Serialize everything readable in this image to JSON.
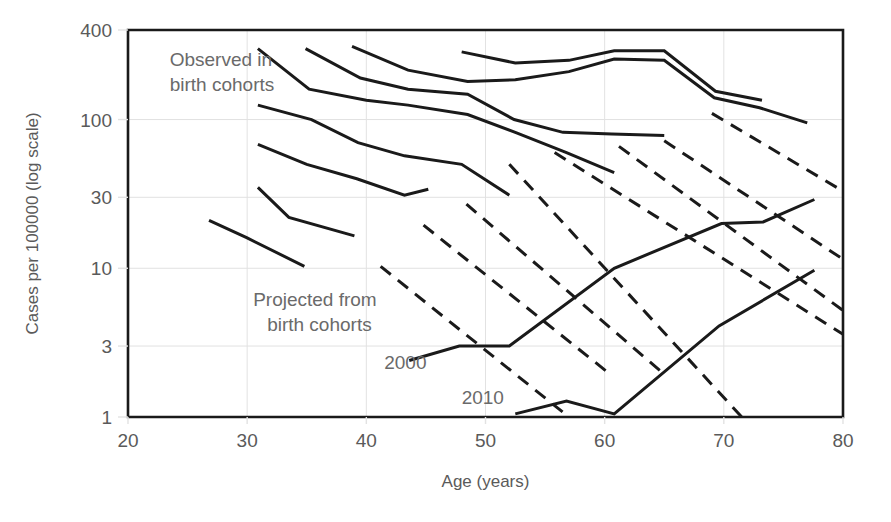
{
  "chart_data": {
    "type": "line",
    "title": "",
    "xlabel": "Age (years)",
    "ylabel": "Cases per 100000 (log scale)",
    "yscale": "log",
    "xlim": [
      20,
      80
    ],
    "ylim": [
      1,
      400
    ],
    "grid": true,
    "legend_position": "none",
    "xticks": [
      "20",
      "30",
      "40",
      "50",
      "60",
      "70",
      "80"
    ],
    "xtick_values": [
      20,
      30,
      40,
      50,
      60,
      70,
      80
    ],
    "yticks": [
      "1",
      "3",
      "10",
      "30",
      "100",
      "400"
    ],
    "ytick_values": [
      1,
      3,
      10,
      30,
      100,
      400
    ],
    "annotations": [
      {
        "id": "observed",
        "text_line1": "Observed in",
        "text_line2": "birth cohorts",
        "x": 23.5,
        "y": 230
      },
      {
        "id": "projected",
        "text_line1": "Projected from",
        "text_line2": "birth cohorts",
        "x": 30.5,
        "y": 5.6
      },
      {
        "id": "label-2000",
        "text": "2000",
        "x": 41.5,
        "y": 2.1
      },
      {
        "id": "label-2010",
        "text": "2010",
        "x": 48.0,
        "y": 1.22
      }
    ],
    "series": [
      {
        "name": "observed-cohort-1",
        "style": "solid",
        "points": [
          [
            26.8,
            21
          ],
          [
            30.0,
            16
          ],
          [
            34.8,
            10.3
          ]
        ]
      },
      {
        "name": "observed-cohort-2",
        "style": "solid",
        "points": [
          [
            30.9,
            35
          ],
          [
            33.5,
            22
          ],
          [
            39.0,
            16.5
          ]
        ]
      },
      {
        "name": "observed-cohort-3",
        "style": "solid",
        "points": [
          [
            30.9,
            68
          ],
          [
            35.0,
            50
          ],
          [
            39.2,
            40
          ],
          [
            43.2,
            31
          ],
          [
            45.2,
            34
          ]
        ]
      },
      {
        "name": "observed-cohort-4",
        "style": "solid",
        "points": [
          [
            30.9,
            125
          ],
          [
            35.4,
            100
          ],
          [
            39.3,
            70
          ],
          [
            43.2,
            57
          ],
          [
            48.0,
            50
          ],
          [
            52.0,
            31
          ]
        ]
      },
      {
        "name": "observed-cohort-5",
        "style": "solid",
        "points": [
          [
            30.9,
            300
          ],
          [
            35.2,
            160
          ],
          [
            40.0,
            135
          ],
          [
            43.5,
            125
          ],
          [
            48.5,
            108
          ],
          [
            52.5,
            82
          ],
          [
            56.8,
            60
          ],
          [
            60.8,
            44
          ]
        ]
      },
      {
        "name": "observed-cohort-6",
        "style": "solid",
        "points": [
          [
            34.9,
            300
          ],
          [
            39.5,
            190
          ],
          [
            43.5,
            160
          ],
          [
            48.5,
            148
          ],
          [
            52.4,
            100
          ],
          [
            56.5,
            82
          ],
          [
            60.6,
            80
          ],
          [
            65.0,
            78
          ]
        ]
      },
      {
        "name": "observed-cohort-7",
        "style": "solid",
        "points": [
          [
            38.8,
            310
          ],
          [
            43.5,
            215
          ],
          [
            48.5,
            180
          ],
          [
            52.5,
            185
          ],
          [
            57.0,
            210
          ],
          [
            60.8,
            255
          ],
          [
            65.0,
            250
          ],
          [
            69.2,
            140
          ],
          [
            73.0,
            120
          ],
          [
            77.0,
            95
          ]
        ]
      },
      {
        "name": "observed-cohort-8",
        "style": "solid",
        "points": [
          [
            48.0,
            285
          ],
          [
            52.5,
            240
          ],
          [
            57.0,
            250
          ],
          [
            60.8,
            290
          ],
          [
            65.0,
            290
          ],
          [
            69.3,
            155
          ],
          [
            73.2,
            135
          ]
        ]
      },
      {
        "name": "period-2000",
        "style": "solid",
        "points": [
          [
            43.6,
            2.4
          ],
          [
            47.8,
            3.0
          ],
          [
            52.0,
            3.0
          ],
          [
            60.8,
            10.0
          ],
          [
            69.8,
            20.0
          ],
          [
            73.3,
            20.5
          ],
          [
            77.6,
            29.0
          ]
        ]
      },
      {
        "name": "period-2010",
        "style": "solid",
        "points": [
          [
            52.5,
            1.05
          ],
          [
            56.8,
            1.28
          ],
          [
            60.8,
            1.05
          ],
          [
            69.6,
            4.1
          ],
          [
            77.6,
            9.7
          ]
        ]
      },
      {
        "name": "projected-1",
        "style": "dashed",
        "points": [
          [
            41.2,
            10.3
          ],
          [
            57.0,
            1.0
          ]
        ]
      },
      {
        "name": "projected-2",
        "style": "dashed",
        "points": [
          [
            44.8,
            19.5
          ],
          [
            60.6,
            1.9
          ]
        ]
      },
      {
        "name": "projected-3",
        "style": "dashed",
        "points": [
          [
            48.4,
            27.0
          ],
          [
            64.8,
            2.0
          ]
        ]
      },
      {
        "name": "projected-4",
        "style": "dashed",
        "points": [
          [
            52.0,
            50.0
          ],
          [
            71.5,
            1.0
          ]
        ]
      },
      {
        "name": "projected-5",
        "style": "dashed",
        "points": [
          [
            55.8,
            60.0
          ],
          [
            80.0,
            3.6
          ]
        ]
      },
      {
        "name": "projected-6",
        "style": "dashed",
        "points": [
          [
            61.2,
            66.0
          ],
          [
            80.0,
            5.2
          ]
        ]
      },
      {
        "name": "projected-7",
        "style": "dashed",
        "points": [
          [
            65.0,
            72.0
          ],
          [
            80.0,
            11.5
          ]
        ]
      },
      {
        "name": "projected-8",
        "style": "dashed",
        "points": [
          [
            69.0,
            110.0
          ],
          [
            80.0,
            33.0
          ]
        ]
      }
    ],
    "colors": {
      "axis": "#1a1a1a",
      "grid": "#e2e2e2",
      "line": "#1a1a1a",
      "text": "#5a5a5a"
    }
  }
}
